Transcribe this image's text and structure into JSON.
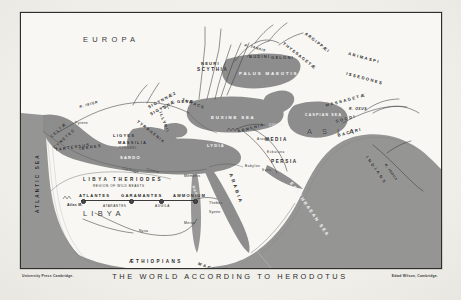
{
  "caption": {
    "title": "THE WORLD ACCORDING TO HERODOTUS",
    "credit_left": "University Press Cambridge.",
    "credit_right": "Edwd Wilson, Cambridge."
  },
  "map": {
    "continents": [
      {
        "name": "EUROPA",
        "x": 62,
        "y": 26
      },
      {
        "name": "LIBYA",
        "x": 72,
        "y": 198
      },
      {
        "name": "ASIA",
        "x": 286,
        "y": 118
      }
    ],
    "seas": [
      {
        "name": "ATLANTIC SEA",
        "x": 16,
        "y": 150
      },
      {
        "name": "EUXINE SEA",
        "x": 196,
        "y": 105
      },
      {
        "name": "PALUS MAEOTIS",
        "x": 228,
        "y": 62
      },
      {
        "name": "CASPIAN SEA",
        "x": 281,
        "y": 100
      },
      {
        "name": "ERYTHRAEAN SEA",
        "x": 286,
        "y": 180
      }
    ],
    "regions": [
      {
        "name": "SCYTHIA",
        "x": 179,
        "y": 56
      },
      {
        "name": "LIBYA THERIODES",
        "x": 63,
        "y": 166
      },
      {
        "name": "REGION OF WILD BEASTS",
        "x": 71,
        "y": 172
      },
      {
        "name": "ARABIA",
        "x": 213,
        "y": 170
      },
      {
        "name": "PERSIA",
        "x": 253,
        "y": 148
      },
      {
        "name": "MEDIA",
        "x": 248,
        "y": 128
      },
      {
        "name": "ARMENIA",
        "x": 222,
        "y": 118
      },
      {
        "name": "LYDIA",
        "x": 190,
        "y": 131
      },
      {
        "name": "ILLYRII",
        "x": 143,
        "y": 108
      },
      {
        "name": "TYRRHENIA",
        "x": 122,
        "y": 112
      },
      {
        "name": "THRACE",
        "x": 166,
        "y": 86
      }
    ],
    "tribes": [
      {
        "name": "CELTÆ",
        "x": 30,
        "y": 116
      },
      {
        "name": "CYNETES",
        "x": 33,
        "y": 126
      },
      {
        "name": "TARTESSUS",
        "x": 36,
        "y": 134
      },
      {
        "name": "IBERES",
        "x": 56,
        "y": 133
      },
      {
        "name": "LIGYES",
        "x": 94,
        "y": 122
      },
      {
        "name": "MASSILIA",
        "x": 99,
        "y": 128
      },
      {
        "name": "TYRSENI",
        "x": 100,
        "y": 133
      },
      {
        "name": "SARDO",
        "x": 100,
        "y": 142
      },
      {
        "name": "SIGYNNÆ",
        "x": 130,
        "y": 98
      },
      {
        "name": "SIGYNNÆ2",
        "x": 128,
        "y": 92
      },
      {
        "name": "GETÆ",
        "x": 158,
        "y": 87
      },
      {
        "name": "NEURI",
        "x": 182,
        "y": 50
      },
      {
        "name": "BUDINI",
        "x": 232,
        "y": 43
      },
      {
        "name": "GELONI",
        "x": 252,
        "y": 44
      },
      {
        "name": "THYSSAGETÆ",
        "x": 268,
        "y": 36
      },
      {
        "name": "ARGIPPÆI",
        "x": 290,
        "y": 25
      },
      {
        "name": "ARIMASPI",
        "x": 332,
        "y": 42
      },
      {
        "name": "ISSEDONES",
        "x": 330,
        "y": 62
      },
      {
        "name": "MASSAGETÆ",
        "x": 308,
        "y": 90
      },
      {
        "name": "SOGDI",
        "x": 316,
        "y": 107
      },
      {
        "name": "BACTRI",
        "x": 318,
        "y": 122
      },
      {
        "name": "INDIANS",
        "x": 350,
        "y": 150
      },
      {
        "name": "COLCHI",
        "x": 250,
        "y": 112
      },
      {
        "name": "ÆTHIOPIANS",
        "x": 110,
        "y": 248
      },
      {
        "name": "MACROBIANS",
        "x": 182,
        "y": 252
      },
      {
        "name": "GARAMANTES",
        "x": 105,
        "y": 182
      },
      {
        "name": "ATLANTES",
        "x": 62,
        "y": 182
      },
      {
        "name": "ATARANTES",
        "x": 85,
        "y": 192
      },
      {
        "name": "AMMONIUM",
        "x": 155,
        "y": 182
      },
      {
        "name": "AUGILA",
        "x": 138,
        "y": 192
      }
    ],
    "cities": [
      {
        "name": "Pyrene",
        "x": 55,
        "y": 110
      },
      {
        "name": "Carthage",
        "x": 105,
        "y": 155
      },
      {
        "name": "Cyrene",
        "x": 128,
        "y": 156
      },
      {
        "name": "Memphis",
        "x": 169,
        "y": 162
      },
      {
        "name": "Thebes",
        "x": 190,
        "y": 189
      },
      {
        "name": "Syene",
        "x": 190,
        "y": 198
      },
      {
        "name": "Meroe",
        "x": 166,
        "y": 209
      },
      {
        "name": "Atlas M.",
        "x": 50,
        "y": 191
      },
      {
        "name": "Babylon",
        "x": 228,
        "y": 152
      },
      {
        "name": "Susa",
        "x": 243,
        "y": 156
      },
      {
        "name": "Ecbatana",
        "x": 250,
        "y": 138
      },
      {
        "name": "Nysa",
        "x": 122,
        "y": 217
      }
    ],
    "rivers": [
      {
        "name": "R. ISTER",
        "x": 60,
        "y": 90
      },
      {
        "name": "R. TANAIS",
        "x": 228,
        "y": 31
      },
      {
        "name": "R. OXUS",
        "x": 330,
        "y": 96
      },
      {
        "name": "R. INDUS",
        "x": 368,
        "y": 158
      },
      {
        "name": "NILE",
        "x": 176,
        "y": 178
      },
      {
        "name": "Araxes",
        "x": 240,
        "y": 125
      }
    ],
    "caravan_route": {
      "label": "caravan-route",
      "y": 187,
      "stops": [
        62,
        110,
        140,
        172
      ]
    }
  },
  "colors": {
    "land_fill": "#8d8d8d",
    "paper": "#f8f7f3",
    "ink": "#2a2a2a",
    "plate": "#f1f0ec"
  }
}
